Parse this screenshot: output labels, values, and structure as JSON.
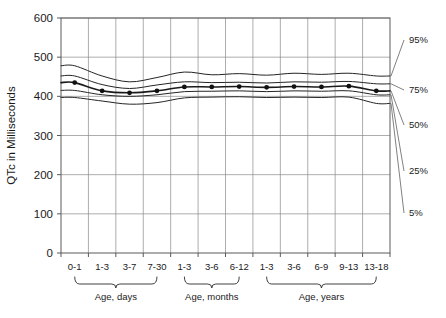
{
  "chart_data": {
    "type": "line",
    "title": "",
    "xlabel": "",
    "ylabel": "QTc in Milliseconds",
    "ylim": [
      0,
      600
    ],
    "yticks": [
      0,
      100,
      200,
      300,
      400,
      500,
      600
    ],
    "grid": true,
    "legend_position": "right-outside",
    "categories": [
      "0-1",
      "1-3",
      "3-7",
      "7-30",
      "1-3",
      "3-6",
      "6-12",
      "1-3",
      "3-6",
      "6-9",
      "9-13",
      "13-18"
    ],
    "category_groups": [
      {
        "label": "Age, days",
        "categories": [
          "0-1",
          "1-3",
          "3-7",
          "7-30"
        ]
      },
      {
        "label": "Age, months",
        "categories": [
          "1-3",
          "3-6",
          "6-12"
        ]
      },
      {
        "label": "Age, years",
        "categories": [
          "1-3",
          "3-6",
          "6-9",
          "9-13",
          "13-18"
        ]
      }
    ],
    "series": [
      {
        "name": "95%",
        "values": [
          478,
          452,
          437,
          448,
          462,
          455,
          458,
          454,
          459,
          456,
          459,
          452
        ]
      },
      {
        "name": "75%",
        "values": [
          452,
          430,
          420,
          429,
          437,
          435,
          436,
          434,
          437,
          436,
          438,
          432
        ]
      },
      {
        "name": "50%",
        "values": [
          435,
          414,
          409,
          414,
          424,
          424,
          425,
          423,
          425,
          424,
          426,
          414
        ],
        "markers": true
      },
      {
        "name": "25%",
        "values": [
          415,
          404,
          400,
          404,
          412,
          413,
          414,
          412,
          414,
          413,
          414,
          404
        ]
      },
      {
        "name": "5%",
        "values": [
          397,
          388,
          380,
          384,
          396,
          398,
          399,
          397,
          398,
          397,
          398,
          382
        ]
      }
    ]
  },
  "annotations": {
    "percentile_labels": [
      "95%",
      "75%",
      "50%",
      "25%",
      "5%"
    ]
  }
}
